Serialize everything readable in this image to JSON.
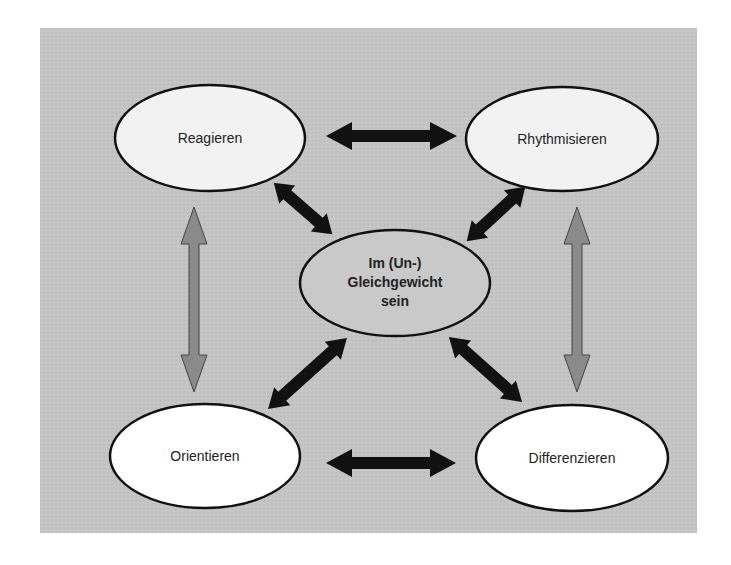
{
  "colors": {
    "background": "#ffffff",
    "panel": "#c4c4c4",
    "ellipse_fill": "#ffffff",
    "ellipse_fill_shaded": "#efefef",
    "center_fill": "#c8c8c8",
    "stroke": "#111111",
    "black_arrow": "#111111",
    "gray_arrow": "#8a8a8a"
  },
  "nodes": {
    "reagieren": {
      "label": "Reagieren"
    },
    "rhythmisieren": {
      "label": "Rhythmisieren"
    },
    "orientieren": {
      "label": "Orientieren"
    },
    "differenzieren": {
      "label": "Differenzieren"
    },
    "center": {
      "line1": "Im (Un-)",
      "line2": "Gleichgewicht",
      "line3": "sein"
    }
  },
  "edges": [
    {
      "from": "Reagieren",
      "to": "Rhythmisieren",
      "type": "bidirectional",
      "style": "black"
    },
    {
      "from": "Orientieren",
      "to": "Differenzieren",
      "type": "bidirectional",
      "style": "black"
    },
    {
      "from": "Reagieren",
      "to": "Orientieren",
      "type": "bidirectional",
      "style": "gray"
    },
    {
      "from": "Rhythmisieren",
      "to": "Differenzieren",
      "type": "bidirectional",
      "style": "gray"
    },
    {
      "from": "Reagieren",
      "to": "Im (Un-) Gleichgewicht sein",
      "type": "bidirectional",
      "style": "black"
    },
    {
      "from": "Rhythmisieren",
      "to": "Im (Un-) Gleichgewicht sein",
      "type": "bidirectional",
      "style": "black"
    },
    {
      "from": "Orientieren",
      "to": "Im (Un-) Gleichgewicht sein",
      "type": "bidirectional",
      "style": "black"
    },
    {
      "from": "Differenzieren",
      "to": "Im (Un-) Gleichgewicht sein",
      "type": "bidirectional",
      "style": "black"
    }
  ]
}
